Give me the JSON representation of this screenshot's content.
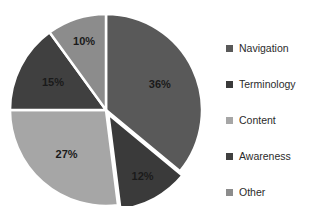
{
  "chart_data": {
    "type": "pie",
    "title": "",
    "subtitle": "",
    "xlabel": "",
    "ylabel": "",
    "grid": false,
    "legend_position": "right",
    "categories": [
      "Navigation",
      "Terminology",
      "Content",
      "Awareness",
      "Other"
    ],
    "values": [
      36,
      12,
      27,
      15,
      10
    ],
    "value_labels": [
      "36%",
      "12%",
      "27%",
      "15%",
      "10%"
    ],
    "colors": [
      "#595959",
      "#3a3a3a",
      "#a6a6a6",
      "#404040",
      "#8c8c8c"
    ],
    "slice_separator_color": "#ffffff",
    "exploded_slices": [
      "Terminology"
    ],
    "background_color": "#ffffff",
    "label_text_color": "#1a1a1a"
  },
  "legend": {
    "items": [
      {
        "label": "Navigation",
        "color": "#595959"
      },
      {
        "label": "Terminology",
        "color": "#3a3a3a"
      },
      {
        "label": "Content",
        "color": "#a6a6a6"
      },
      {
        "label": "Awareness",
        "color": "#404040"
      },
      {
        "label": "Other",
        "color": "#8c8c8c"
      }
    ]
  },
  "slice_labels": {
    "navigation": "36%",
    "terminology": "12%",
    "content": "27%",
    "awareness": "15%",
    "other": "10%"
  }
}
